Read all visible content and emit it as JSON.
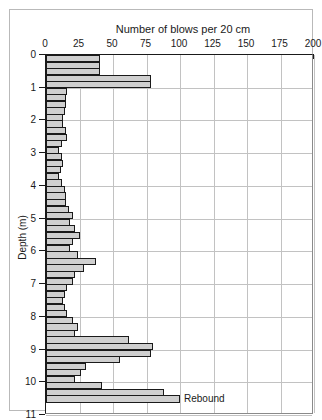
{
  "chart_data": {
    "type": "bar",
    "orientation": "horizontal",
    "title": "Number of blows per 20 cm",
    "xlabel": "Number of blows per 20 cm",
    "ylabel": "Depth (m)",
    "xlim": [
      0,
      200
    ],
    "ylim": [
      0,
      11
    ],
    "xticks": [
      0,
      25,
      50,
      75,
      100,
      125,
      150,
      175,
      200
    ],
    "xtick_labels": [
      "0",
      "25",
      "50",
      "75",
      "100",
      "125",
      "150",
      "175",
      "200"
    ],
    "x_minor_tick_step": 5,
    "yticks": [
      0,
      1,
      2,
      3,
      4,
      5,
      6,
      7,
      8,
      9,
      10,
      11
    ],
    "ytick_labels": [
      "0",
      "1",
      "2",
      "3",
      "4",
      "5",
      "6",
      "7",
      "8",
      "9",
      "10",
      "11"
    ],
    "grid": true,
    "grid_axis": "both",
    "legend": null,
    "bar_interval_m": 0.2,
    "bar_fill_color": "#cfcfcf",
    "bar_edge_color": "#1a1a1a",
    "annotations": [
      {
        "text": "Rebound",
        "depth_m": 10.5,
        "value": 100
      }
    ],
    "depths": [
      0.2,
      0.4,
      0.6,
      0.8,
      1.0,
      1.2,
      1.4,
      1.6,
      1.8,
      2.0,
      2.2,
      2.4,
      2.6,
      2.8,
      3.0,
      3.2,
      3.4,
      3.6,
      3.8,
      4.0,
      4.2,
      4.4,
      4.6,
      4.8,
      5.0,
      5.2,
      5.4,
      5.6,
      5.8,
      6.0,
      6.2,
      6.4,
      6.6,
      6.8,
      7.0,
      7.2,
      7.4,
      7.6,
      7.8,
      8.0,
      8.2,
      8.4,
      8.6,
      8.8,
      9.0,
      9.2,
      9.4,
      9.6,
      9.8,
      10.0,
      10.2,
      10.4,
      10.6
    ],
    "values": [
      40,
      40,
      40,
      78,
      78,
      16,
      15,
      15,
      14,
      13,
      13,
      15,
      16,
      12,
      10,
      12,
      13,
      11,
      10,
      12,
      14,
      15,
      15,
      17,
      20,
      18,
      22,
      25,
      20,
      18,
      24,
      37,
      28,
      22,
      20,
      16,
      14,
      13,
      14,
      16,
      20,
      24,
      22,
      62,
      80,
      78,
      55,
      30,
      26,
      22,
      42,
      88,
      100
    ]
  }
}
